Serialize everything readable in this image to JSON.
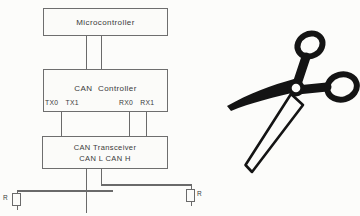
{
  "diagram": {
    "microcontroller": {
      "label": "Microcontroller"
    },
    "controller": {
      "label": "CAN  Controller",
      "tx_pins": "TX0 TX1",
      "rx_pins": "RX0  RX1"
    },
    "transceiver": {
      "title": "CAN Transceiver",
      "subtitle": "CAN L CAN H"
    },
    "termination": {
      "left": "R",
      "right": "R"
    },
    "colors": {
      "wire": "#6a6a6a",
      "box_border": "#6e6e6e",
      "text": "#3a3a3a",
      "scissors": "#141414",
      "background": "#fcfcfa"
    }
  }
}
